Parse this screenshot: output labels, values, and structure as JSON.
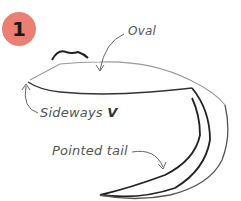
{
  "step": {
    "number": "1",
    "badge_color": "#ec7f74"
  },
  "labels": {
    "oval": "Oval",
    "sideways_v_prefix": "Sideways ",
    "sideways_v_letter": "V",
    "pointed_tail": "Pointed tail"
  },
  "colors": {
    "stroke": "#222222",
    "light_stroke": "#888888",
    "text": "#555555"
  }
}
